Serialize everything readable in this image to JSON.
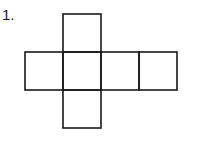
{
  "problem": {
    "number_label": "1.",
    "figure": "cube net",
    "squares": [
      {
        "id": "top",
        "x": 63,
        "y": 14,
        "size": 38
      },
      {
        "id": "left",
        "x": 25,
        "y": 52,
        "size": 38
      },
      {
        "id": "center",
        "x": 63,
        "y": 52,
        "size": 38
      },
      {
        "id": "right",
        "x": 101,
        "y": 52,
        "size": 38
      },
      {
        "id": "far-right",
        "x": 139,
        "y": 52,
        "size": 38
      },
      {
        "id": "bottom",
        "x": 63,
        "y": 90,
        "size": 38
      }
    ],
    "stroke_color": "#1a1a1a"
  }
}
